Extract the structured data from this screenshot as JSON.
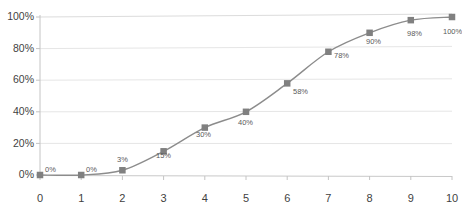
{
  "chart_data": {
    "type": "line",
    "title": "",
    "subtitle": "",
    "xlabel": "",
    "ylabel": "",
    "x": [
      0,
      1,
      2,
      3,
      4,
      5,
      6,
      7,
      8,
      9,
      10
    ],
    "values": [
      0,
      0,
      3,
      15,
      30,
      40,
      58,
      78,
      90,
      98,
      100
    ],
    "data_labels": [
      "0%",
      "0%",
      "3%",
      "15%",
      "30%",
      "40%",
      "58%",
      "78%",
      "90%",
      "98%",
      "100%"
    ],
    "xticks": [
      "0",
      "1",
      "2",
      "3",
      "4",
      "5",
      "6",
      "7",
      "8",
      "9",
      "10"
    ],
    "yticks": [
      "0%",
      "20%",
      "40%",
      "60%",
      "80%",
      "100%"
    ],
    "ytick_values": [
      0,
      20,
      40,
      60,
      80,
      100
    ],
    "xlim": [
      0,
      10
    ],
    "ylim": [
      0,
      100
    ],
    "grid": true,
    "grid_axis": "y",
    "legend": false,
    "legend_position": "none",
    "marker": "square",
    "series_name": "Cumulative percent",
    "colors": {
      "line": "#8c8c8c",
      "marker": "#808080",
      "grid": "#e2e2e2",
      "axis": "#bfbfbf",
      "tick_text": "#3f3f3f",
      "label_text": "#5a5a5a",
      "background": "#ffffff"
    }
  }
}
